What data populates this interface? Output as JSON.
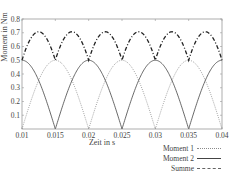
{
  "chart_data": {
    "type": "line",
    "title": "",
    "xlabel": "Zeit in s",
    "ylabel": "Moment in Nm",
    "xlim": [
      0.01,
      0.04
    ],
    "ylim": [
      0,
      0.8
    ],
    "xticks": [
      "0.01",
      "0.015",
      "0.02",
      "0.025",
      "0.03",
      "0.035",
      "0.04"
    ],
    "yticks": [
      "0.1",
      "0.2",
      "0.3",
      "0.4",
      "0.5",
      "0.6",
      "0.7",
      "0.8"
    ],
    "grid": false,
    "legend_position": "below-right",
    "x": [
      0.01,
      0.0125,
      0.015,
      0.0175,
      0.02,
      0.0225,
      0.025,
      0.0275,
      0.03,
      0.0325,
      0.035,
      0.0375,
      0.04
    ],
    "series": [
      {
        "name": "Moment 1",
        "style": "dotted",
        "color": "#8a8a8a",
        "values": [
          0.0,
          0.354,
          0.5,
          0.354,
          0.0,
          0.354,
          0.5,
          0.354,
          0.0,
          0.354,
          0.5,
          0.354,
          0.0
        ]
      },
      {
        "name": "Moment 2",
        "style": "solid",
        "color": "#444444",
        "values": [
          0.5,
          0.354,
          0.0,
          0.354,
          0.5,
          0.354,
          0.0,
          0.354,
          0.5,
          0.354,
          0.0,
          0.354,
          0.5
        ]
      },
      {
        "name": "Summe",
        "style": "dash-dot",
        "color": "#222222",
        "values": [
          0.5,
          0.707,
          0.5,
          0.707,
          0.5,
          0.707,
          0.5,
          0.707,
          0.5,
          0.707,
          0.5,
          0.707,
          0.5
        ]
      }
    ]
  },
  "legend": {
    "items": [
      {
        "label": "Moment 1"
      },
      {
        "label": "Moment 2"
      },
      {
        "label": "Summe"
      }
    ]
  },
  "axes": {
    "xlabel": "Zeit in s",
    "ylabel": "Moment in Nm"
  }
}
